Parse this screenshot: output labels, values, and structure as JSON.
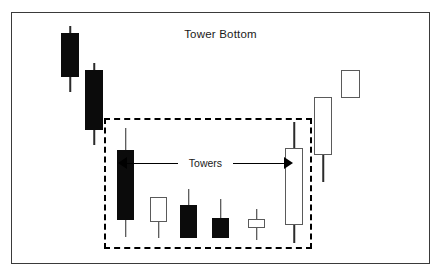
{
  "figure": {
    "title": "Tower Bottom",
    "annotation_label": "Towers",
    "frame_color": "#3a3a3a",
    "background_color": "#ffffff",
    "bear_color": "#0b0b0b",
    "bull_color": "#ffffff",
    "outline_color": "#5a5a5a",
    "highlight_box_style": "dashed",
    "highlight_box_color": "#000000"
  },
  "chart_data": {
    "type": "candlestick",
    "title": "Tower Bottom",
    "xlabel": "",
    "ylabel": "",
    "grid": false,
    "legend": "none",
    "annotations": [
      {
        "text": "Towers",
        "type": "double-arrow",
        "from_candle": 3,
        "to_candle": 8,
        "description": "Double-headed arrow spanning the two tall tower candles"
      },
      {
        "text": "",
        "type": "dashed-rectangle",
        "covers_candles": [
          3,
          4,
          5,
          6,
          7,
          8
        ],
        "description": "Dashed box enclosing the tower bottom pattern"
      }
    ],
    "candles": [
      {
        "index": 1,
        "type": "bearish",
        "x": 61,
        "width": 18,
        "open_y": 33,
        "close_y": 77,
        "high_y": 26,
        "low_y": 92,
        "in_pattern": false
      },
      {
        "index": 2,
        "type": "bearish",
        "x": 85,
        "width": 18,
        "open_y": 70,
        "close_y": 130,
        "high_y": 63,
        "low_y": 145,
        "in_pattern": false
      },
      {
        "index": 3,
        "type": "bearish",
        "x": 117,
        "width": 17,
        "open_y": 150,
        "close_y": 220,
        "high_y": 128,
        "low_y": 237,
        "in_pattern": true,
        "role": "left-tower"
      },
      {
        "index": 4,
        "type": "bullish",
        "x": 150,
        "width": 17,
        "open_y": 222,
        "close_y": 197,
        "high_y": 197,
        "low_y": 238,
        "in_pattern": true
      },
      {
        "index": 5,
        "type": "bearish",
        "x": 180,
        "width": 17,
        "open_y": 205,
        "close_y": 238,
        "high_y": 189,
        "low_y": 238,
        "in_pattern": true
      },
      {
        "index": 6,
        "type": "bearish",
        "x": 212,
        "width": 17,
        "open_y": 218,
        "close_y": 238,
        "high_y": 199,
        "low_y": 238,
        "in_pattern": true
      },
      {
        "index": 7,
        "type": "bullish",
        "x": 248,
        "width": 17,
        "open_y": 228,
        "close_y": 219,
        "high_y": 209,
        "low_y": 240,
        "in_pattern": true
      },
      {
        "index": 8,
        "type": "bullish",
        "x": 285,
        "width": 18,
        "open_y": 225,
        "close_y": 148,
        "high_y": 122,
        "low_y": 243,
        "in_pattern": true,
        "role": "right-tower"
      },
      {
        "index": 9,
        "type": "bullish",
        "x": 314,
        "width": 18,
        "open_y": 155,
        "close_y": 97,
        "high_y": 97,
        "low_y": 182,
        "in_pattern": false
      },
      {
        "index": 10,
        "type": "bullish",
        "x": 341,
        "width": 19,
        "open_y": 98,
        "close_y": 70,
        "high_y": 70,
        "low_y": 98,
        "in_pattern": false
      }
    ]
  }
}
